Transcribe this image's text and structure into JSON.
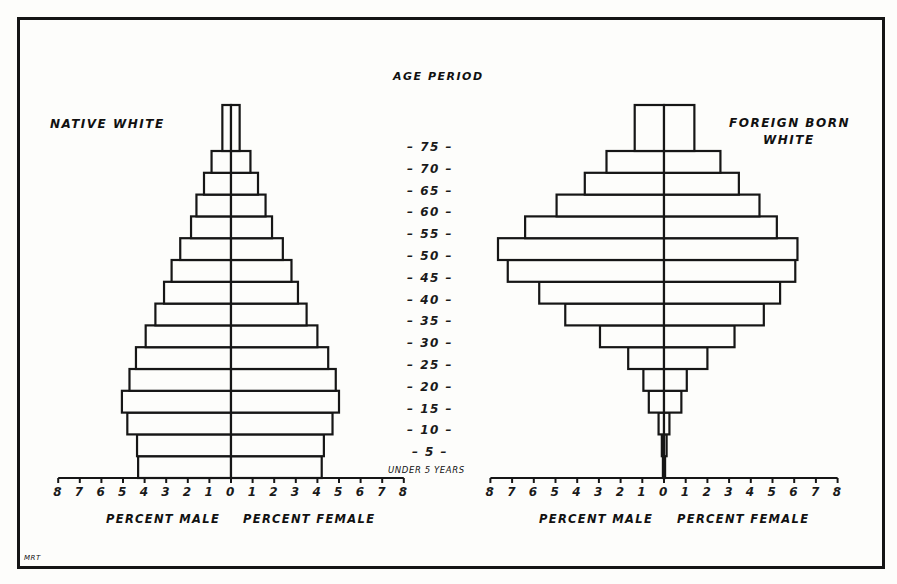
{
  "chart_data": [
    {
      "type": "bar",
      "subtype": "population-pyramid",
      "title": "NATIVE WHITE",
      "center_label": "AGE PERIOD",
      "categories": [
        "Under 5",
        "5-9",
        "10-14",
        "15-19",
        "20-24",
        "25-29",
        "30-34",
        "35-39",
        "40-44",
        "45-49",
        "50-54",
        "55-59",
        "60-64",
        "65-69",
        "70-74",
        "75+"
      ],
      "series": [
        {
          "name": "Percent Male",
          "values": [
            4.3,
            4.35,
            4.8,
            5.05,
            4.7,
            4.4,
            3.95,
            3.5,
            3.1,
            2.75,
            2.35,
            1.85,
            1.6,
            1.25,
            0.9,
            0.4
          ]
        },
        {
          "name": "Percent Female",
          "values": [
            4.2,
            4.3,
            4.7,
            5.0,
            4.85,
            4.5,
            4.0,
            3.5,
            3.1,
            2.8,
            2.4,
            1.9,
            1.6,
            1.25,
            0.9,
            0.4
          ]
        }
      ],
      "xlabel": "PERCENT MALE    PERCENT FEMALE",
      "xticks": [
        8,
        7,
        6,
        5,
        4,
        3,
        2,
        1,
        0,
        1,
        2,
        3,
        4,
        5,
        6,
        7,
        8
      ],
      "xlim": [
        -8,
        8
      ],
      "grid": false
    },
    {
      "type": "bar",
      "subtype": "population-pyramid",
      "title": "FOREIGN BORN WHITE",
      "center_label": "AGE PERIOD",
      "categories": [
        "Under 5",
        "5-9",
        "10-14",
        "15-19",
        "20-24",
        "25-29",
        "30-34",
        "35-39",
        "40-44",
        "45-49",
        "50-54",
        "55-59",
        "60-64",
        "65-69",
        "70-74",
        "75+"
      ],
      "series": [
        {
          "name": "Percent Male",
          "values": [
            0.05,
            0.1,
            0.25,
            0.7,
            0.95,
            1.65,
            2.95,
            4.55,
            5.75,
            7.2,
            7.65,
            6.4,
            4.95,
            3.65,
            2.65,
            1.35
          ]
        },
        {
          "name": "Percent Female",
          "values": [
            0.05,
            0.12,
            0.25,
            0.8,
            1.05,
            2.0,
            3.25,
            4.6,
            5.35,
            6.05,
            6.15,
            5.2,
            4.4,
            3.45,
            2.6,
            1.4
          ]
        }
      ],
      "xlabel": "PERCENT MALE    PERCENT FEMALE",
      "xticks": [
        8,
        7,
        6,
        5,
        4,
        3,
        2,
        1,
        0,
        1,
        2,
        3,
        4,
        5,
        6,
        7,
        8
      ],
      "xlim": [
        -8,
        8
      ],
      "grid": false
    }
  ],
  "labels": {
    "center_title": "AGE PERIOD",
    "age_ticks": [
      "75",
      "70",
      "65",
      "60",
      "55",
      "50",
      "45",
      "40",
      "35",
      "30",
      "25",
      "20",
      "15",
      "10",
      "5"
    ],
    "under_label": "UNDER 5 YEARS",
    "left_title": "NATIVE WHITE",
    "right_title_line1": "FOREIGN BORN",
    "right_title_line2": "WHITE",
    "x_label_male": "PERCENT MALE",
    "x_label_female": "PERCENT FEMALE",
    "signature": "MRT"
  }
}
